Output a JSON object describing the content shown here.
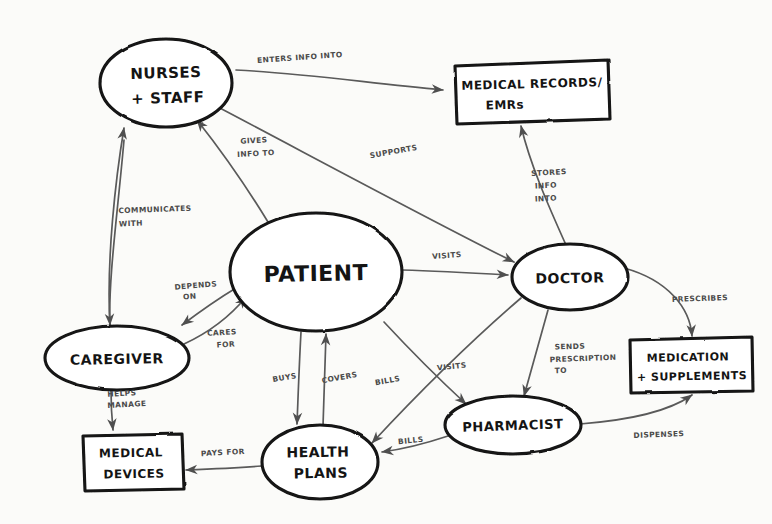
{
  "diagram": {
    "style": "hand-drawn sketch",
    "background_color": "#fbfbf9",
    "ink_color": "#121212",
    "edge_color": "#5a5a5a",
    "nodes": [
      {
        "id": "nurses",
        "label_line1": "NURSES",
        "label_line2": "+ STAFF",
        "shape": "ellipse",
        "cx": 166,
        "cy": 83,
        "rx": 66,
        "ry": 44,
        "font_size": 15
      },
      {
        "id": "records",
        "label_line1": "MEDICAL RECORDS/",
        "label_line2": "EMRs",
        "shape": "box",
        "cx": 530,
        "cy": 92,
        "w": 155,
        "h": 58,
        "font_size": 12
      },
      {
        "id": "patient",
        "label_line1": "PATIENT",
        "label_line2": "",
        "shape": "ellipse",
        "cx": 316,
        "cy": 272,
        "rx": 86,
        "ry": 59,
        "font_size": 22
      },
      {
        "id": "doctor",
        "label_line1": "DOCTOR",
        "label_line2": "",
        "shape": "ellipse",
        "cx": 570,
        "cy": 277,
        "rx": 58,
        "ry": 33,
        "font_size": 14
      },
      {
        "id": "caregiver",
        "label_line1": "CAREGIVER",
        "label_line2": "",
        "shape": "ellipse",
        "cx": 117,
        "cy": 358,
        "rx": 72,
        "ry": 32,
        "font_size": 14
      },
      {
        "id": "devices",
        "label_line1": "MEDICAL",
        "label_line2": "DEVICES",
        "shape": "box",
        "cx": 131,
        "cy": 461,
        "w": 100,
        "h": 53,
        "font_size": 12
      },
      {
        "id": "healthplans",
        "label_line1": "HEALTH",
        "label_line2": "PLANS",
        "shape": "ellipse",
        "cx": 320,
        "cy": 462,
        "rx": 58,
        "ry": 37,
        "font_size": 14
      },
      {
        "id": "pharmacist",
        "label_line1": "PHARMACIST",
        "label_line2": "",
        "shape": "ellipse",
        "cx": 513,
        "cy": 425,
        "rx": 68,
        "ry": 29,
        "font_size": 13
      },
      {
        "id": "medication",
        "label_line1": "MEDICATION",
        "label_line2": "+ SUPPLEMENTS",
        "shape": "box",
        "cx": 690,
        "cy": 365,
        "w": 122,
        "h": 52,
        "font_size": 11
      }
    ],
    "edges": [
      {
        "id": "nurses-records",
        "label": "ENTERS INFO INTO",
        "from": "nurses",
        "to": "records",
        "label_x": 300,
        "label_y": 60,
        "label_rotate": -4
      },
      {
        "id": "nurses-doctor",
        "label": "SUPPORTS",
        "from": "nurses",
        "to": "doctor",
        "label_x": 394,
        "label_y": 154,
        "label_rotate": -10
      },
      {
        "id": "patient-nurses",
        "label": "GIVES INFO TO",
        "from": "patient",
        "to": "nurses",
        "label_x": 254,
        "label_y": 147,
        "label_rotate": 0
      },
      {
        "id": "caregiver-nurses",
        "label": "COMMUNICATES WITH",
        "from": "caregiver",
        "to": "nurses",
        "label_x": 152,
        "label_y": 215,
        "label_rotate": 0
      },
      {
        "id": "doctor-records",
        "label": "STORES INFO INTO",
        "from": "doctor",
        "to": "records",
        "label_x": 545,
        "label_y": 180,
        "label_rotate": 0
      },
      {
        "id": "patient-doctor",
        "label": "VISITS",
        "from": "patient",
        "to": "doctor",
        "label_x": 447,
        "label_y": 258,
        "label_rotate": 0
      },
      {
        "id": "patient-caregiver",
        "label": "DEPENDS ON",
        "from": "patient",
        "to": "caregiver",
        "label_x": 196,
        "label_y": 290,
        "label_rotate": 0
      },
      {
        "id": "caregiver-patient",
        "label": "CARES FOR",
        "from": "caregiver",
        "to": "patient",
        "label_x": 222,
        "label_y": 336,
        "label_rotate": 0
      },
      {
        "id": "caregiver-devices",
        "label": "HELPS MANAGE",
        "from": "caregiver",
        "to": "devices",
        "label_x": 121,
        "label_y": 399,
        "label_rotate": 0
      },
      {
        "id": "patient-healthplans",
        "label": "BUYS",
        "from": "patient",
        "to": "healthplans",
        "label_x": 288,
        "label_y": 378,
        "label_rotate": -8
      },
      {
        "id": "healthplans-patient",
        "label": "COVERS",
        "from": "healthplans",
        "to": "patient",
        "label_x": 335,
        "label_y": 378,
        "label_rotate": -8
      },
      {
        "id": "patient-pharmacist",
        "label": "VISITS",
        "from": "patient",
        "to": "pharmacist",
        "label_x": 452,
        "label_y": 369,
        "label_rotate": 0
      },
      {
        "id": "doctor-healthplans",
        "label": "BILLS",
        "from": "doctor",
        "to": "healthplans",
        "label_x": 388,
        "label_y": 383,
        "label_rotate": -8
      },
      {
        "id": "doctor-pharmacist",
        "label": "SENDS PRESCRIPTION TO",
        "from": "doctor",
        "to": "pharmacist",
        "label_x": 565,
        "label_y": 363,
        "label_rotate": 0
      },
      {
        "id": "doctor-medication",
        "label": "PRESCRIBES",
        "from": "doctor",
        "to": "medication",
        "label_x": 697,
        "label_y": 301,
        "label_rotate": 0
      },
      {
        "id": "pharmacist-medication",
        "label": "DISPENSES",
        "from": "pharmacist",
        "to": "medication",
        "label_x": 659,
        "label_y": 437,
        "label_rotate": 0
      },
      {
        "id": "pharmacist-healthplans",
        "label": "BILLS",
        "from": "pharmacist",
        "to": "healthplans",
        "label_x": 411,
        "label_y": 443,
        "label_rotate": -4
      },
      {
        "id": "healthplans-devices",
        "label": "PAYS FOR",
        "from": "healthplans",
        "to": "devices",
        "label_x": 223,
        "label_y": 455,
        "label_rotate": -3
      }
    ]
  }
}
